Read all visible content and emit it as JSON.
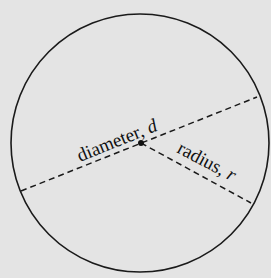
{
  "diagram": {
    "background": "#e4e4e4",
    "stroke_color": "#1a1a1a",
    "circle": {
      "cx": 140,
      "cy": 143,
      "r": 129
    },
    "center": {
      "x": 141,
      "y": 143
    },
    "diameter": {
      "label_text": "diameter, ",
      "label_var": "d",
      "from": {
        "x": 21,
        "y": 191
      },
      "to": {
        "x": 257,
        "y": 97
      }
    },
    "radius": {
      "label_text": "radius, ",
      "label_var": "r",
      "from": {
        "x": 141,
        "y": 143
      },
      "to": {
        "x": 251,
        "y": 203
      }
    }
  }
}
